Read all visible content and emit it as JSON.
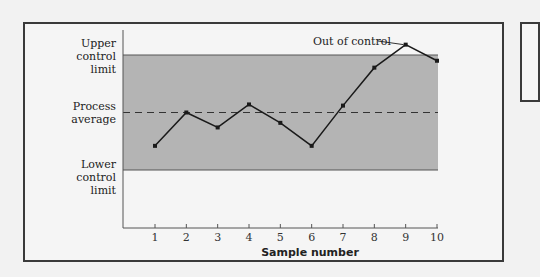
{
  "chart_data": {
    "type": "line",
    "title": "",
    "xlabel": "Sample number",
    "ylabel": "",
    "x": [
      1,
      2,
      3,
      4,
      5,
      6,
      7,
      8,
      9,
      10
    ],
    "series": [
      {
        "name": "Sample measurement",
        "values": [
          21,
          50,
          37,
          57,
          41,
          21,
          56,
          89,
          109,
          95
        ]
      }
    ],
    "reference_lines": {
      "upper_control_limit": {
        "label": "Upper control limit",
        "value": 100
      },
      "process_average": {
        "label": "Process average",
        "value": 50,
        "style": "dashed"
      },
      "lower_control_limit": {
        "label": "Lower control limit",
        "value": 0
      }
    },
    "annotations": [
      {
        "text": "Out of control",
        "x": 9,
        "value": 109
      }
    ],
    "x_ticks": [
      "1",
      "2",
      "3",
      "4",
      "5",
      "6",
      "7",
      "8",
      "9",
      "10"
    ],
    "y_ticks": [],
    "ylim": [
      -50,
      130
    ],
    "grid": false,
    "legend": "none",
    "shaded_band": {
      "from": 0,
      "to": 100,
      "color": "#b4b4b4"
    }
  },
  "labels": {
    "ucl_line1": "Upper",
    "ucl_line2": "control",
    "ucl_line3": "limit",
    "avg_line1": "Process",
    "avg_line2": "average",
    "lcl_line1": "Lower",
    "lcl_line2": "control",
    "lcl_line3": "limit",
    "out_of_control": "Out of control",
    "x_title": "Sample number"
  },
  "colors": {
    "band": "#b4b4b4",
    "line": "#1a1a1a",
    "frame": "#3a3a3a",
    "background": "#f5f5f5"
  }
}
